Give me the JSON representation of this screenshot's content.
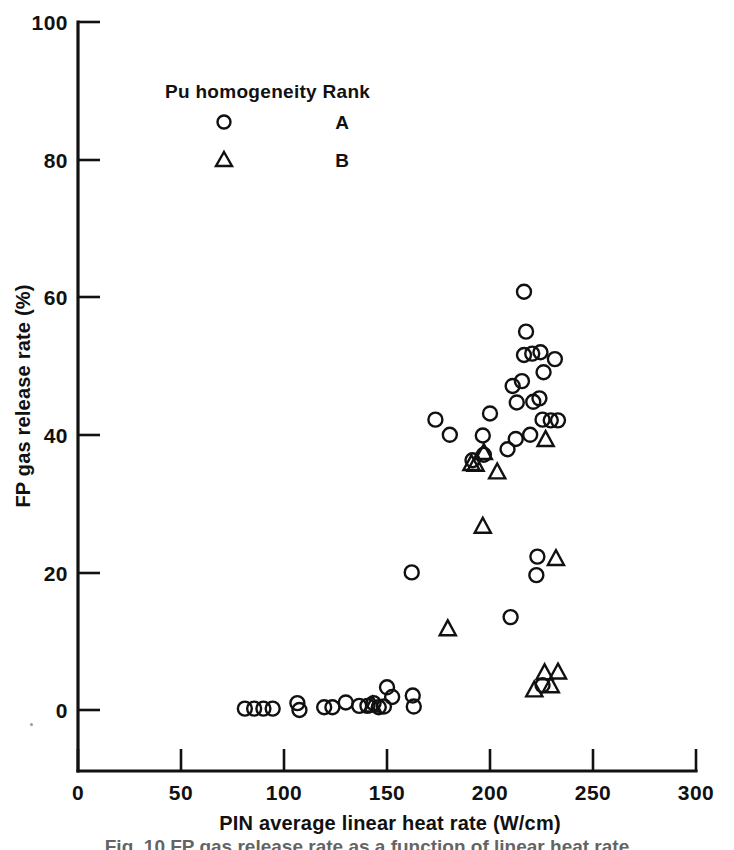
{
  "chart_data": {
    "type": "scatter",
    "title": "",
    "xlabel": "PIN average linear heat rate (W/cm)",
    "ylabel": "FP gas release rate (%)",
    "xlim": [
      0,
      300
    ],
    "ylim": [
      0,
      100
    ],
    "xticks": [
      0,
      50,
      100,
      150,
      200,
      250,
      300
    ],
    "xtick_labels": [
      "0",
      "50",
      "100",
      "150",
      "200",
      "250",
      "300"
    ],
    "yticks": [
      0,
      20,
      40,
      60,
      80,
      100
    ],
    "ytick_labels": [
      "0",
      "20",
      "40",
      "60",
      "80",
      "100"
    ],
    "grid": false,
    "legend_position": "upper-left-inside",
    "legend_title": "Pu homogeneity Rank",
    "series": [
      {
        "name": "A",
        "marker": "circle",
        "points": [
          [
            81.0,
            0.2
          ],
          [
            85.5,
            0.2
          ],
          [
            90.0,
            0.2
          ],
          [
            94.5,
            0.2
          ],
          [
            106.5,
            1.0
          ],
          [
            107.5,
            0.0
          ],
          [
            119.5,
            0.4
          ],
          [
            123.5,
            0.4
          ],
          [
            130.0,
            1.1
          ],
          [
            136.5,
            0.6
          ],
          [
            140.5,
            0.6
          ],
          [
            143.5,
            1.0
          ],
          [
            146.0,
            0.4
          ],
          [
            148.5,
            0.5
          ],
          [
            150.0,
            3.3
          ],
          [
            152.5,
            1.9
          ],
          [
            162.5,
            2.1
          ],
          [
            163.0,
            0.5
          ],
          [
            162.0,
            20.0
          ],
          [
            173.5,
            42.2
          ],
          [
            180.5,
            40.0
          ],
          [
            191.5,
            36.3
          ],
          [
            196.5,
            39.9
          ],
          [
            197.0,
            37.1
          ],
          [
            200.0,
            43.1
          ],
          [
            208.5,
            37.9
          ],
          [
            210.0,
            13.5
          ],
          [
            211.0,
            47.1
          ],
          [
            212.5,
            39.4
          ],
          [
            213.0,
            44.7
          ],
          [
            215.5,
            47.8
          ],
          [
            216.5,
            60.8
          ],
          [
            217.5,
            55.0
          ],
          [
            216.5,
            51.6
          ],
          [
            220.5,
            51.8
          ],
          [
            221.0,
            44.8
          ],
          [
            222.5,
            19.6
          ],
          [
            224.0,
            45.3
          ],
          [
            224.5,
            52.0
          ],
          [
            223.0,
            22.3
          ],
          [
            226.0,
            49.1
          ],
          [
            225.5,
            42.2
          ],
          [
            225.5,
            3.6
          ],
          [
            229.5,
            42.1
          ],
          [
            233.0,
            42.1
          ],
          [
            231.5,
            51.0
          ],
          [
            219.5,
            40.0
          ]
        ]
      },
      {
        "name": "B",
        "marker": "triangle",
        "points": [
          [
            143.0,
            0.7
          ],
          [
            179.5,
            11.8
          ],
          [
            191.0,
            35.8
          ],
          [
            193.0,
            35.7
          ],
          [
            196.5,
            26.7
          ],
          [
            197.0,
            37.4
          ],
          [
            203.5,
            34.6
          ],
          [
            221.5,
            2.9
          ],
          [
            226.5,
            5.4
          ],
          [
            229.5,
            3.5
          ],
          [
            233.0,
            5.5
          ],
          [
            232.0,
            22.0
          ],
          [
            227.0,
            39.3
          ]
        ]
      }
    ]
  },
  "legend": {
    "title": "Pu homogeneity Rank",
    "rows": [
      {
        "marker": "circle-marker",
        "rank": "A"
      },
      {
        "marker": "triangle-marker",
        "rank": "B"
      }
    ]
  },
  "axes": {
    "x_title": "PIN average linear heat rate (W/cm)",
    "y_title": "FP gas release rate (%)"
  },
  "caption": {
    "partial_text": "Fig. 10   FP gas release rate as a function of linear heat rate"
  }
}
